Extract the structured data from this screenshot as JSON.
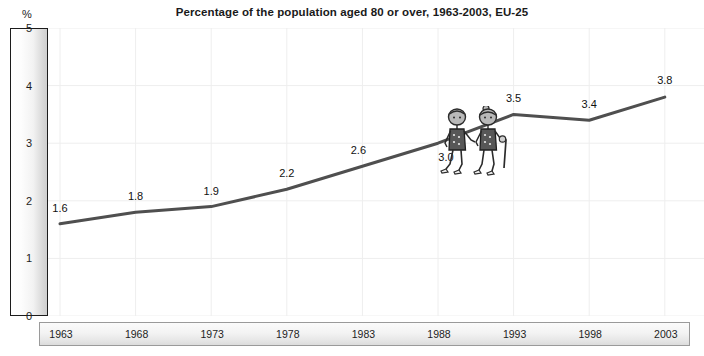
{
  "chart_data": {
    "type": "line",
    "title": "Percentage of the population aged 80 or over, 1963-2003, EU-25",
    "xlabel": "",
    "ylabel": "%",
    "categories": [
      "1963",
      "1968",
      "1973",
      "1978",
      "1983",
      "1988",
      "1993",
      "1998",
      "2003"
    ],
    "x": [
      1963,
      1968,
      1973,
      1978,
      1983,
      1988,
      1993,
      1998,
      2003
    ],
    "values": [
      1.6,
      1.8,
      1.9,
      2.2,
      2.6,
      3.0,
      3.5,
      3.4,
      3.8
    ],
    "point_labels": [
      "1.6",
      "1.8",
      "1.9",
      "2.2",
      "2.6",
      "3.0",
      "3.5",
      "3.4",
      "3.8"
    ],
    "ylim": [
      0,
      5
    ],
    "y_ticks": [
      "0",
      "1",
      "2",
      "3",
      "4",
      "5"
    ],
    "grid": true,
    "legend": "none",
    "line_color": "#4f4f4f",
    "series": [
      {
        "name": "Percentage of population aged 80 or over",
        "values": [
          1.6,
          1.8,
          1.9,
          2.2,
          2.6,
          3.0,
          3.5,
          3.4,
          3.8
        ]
      }
    ]
  },
  "axes": {
    "y_unit": "%",
    "y_ticks": [
      {
        "label": "5",
        "value": 5
      },
      {
        "label": "4",
        "value": 4
      },
      {
        "label": "3",
        "value": 3
      },
      {
        "label": "2",
        "value": 2
      },
      {
        "label": "1",
        "value": 1
      },
      {
        "label": "0",
        "value": 0
      }
    ],
    "x_ticks": [
      {
        "label": "1963"
      },
      {
        "label": "1968"
      },
      {
        "label": "1973"
      },
      {
        "label": "1978"
      },
      {
        "label": "1983"
      },
      {
        "label": "1988"
      },
      {
        "label": "1993"
      },
      {
        "label": "1998"
      },
      {
        "label": "2003"
      }
    ]
  },
  "illustration": {
    "name": "two-elderly-people-walking-uphill",
    "figures": [
      {
        "name": "elderly-person-front",
        "accessory": "none"
      },
      {
        "name": "elderly-person-back",
        "accessory": "walking-cane"
      }
    ]
  },
  "colors": {
    "line": "#4f4f4f",
    "grid": "#eeeeee",
    "axis_border": "#1c1c1c",
    "text": "#111111",
    "background": "#ffffff"
  }
}
